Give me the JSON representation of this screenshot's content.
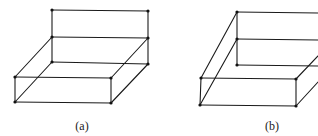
{
  "figures": [
    {
      "id": "a",
      "caption": "(a)",
      "caption_pos": [
        82,
        130
      ],
      "vertices": [
        [
          52,
          10
        ],
        [
          148,
          11
        ],
        [
          52,
          37
        ],
        [
          148,
          38
        ],
        [
          52,
          62
        ],
        [
          148,
          64
        ],
        [
          15,
          77
        ],
        [
          111,
          78
        ],
        [
          15,
          102
        ],
        [
          111,
          103
        ]
      ],
      "edges": [
        [
          [
            52,
            10
          ],
          [
            148,
            11
          ]
        ],
        [
          [
            52,
            10
          ],
          [
            52,
            62
          ]
        ],
        [
          [
            148,
            11
          ],
          [
            148,
            64
          ]
        ],
        [
          [
            52,
            37
          ],
          [
            148,
            38
          ]
        ],
        [
          [
            52,
            62
          ],
          [
            148,
            64
          ]
        ],
        [
          [
            52,
            37
          ],
          [
            15,
            77
          ]
        ],
        [
          [
            148,
            38
          ],
          [
            111,
            78
          ]
        ],
        [
          [
            52,
            62
          ],
          [
            15,
            102
          ]
        ],
        [
          [
            148,
            64
          ],
          [
            111,
            103
          ]
        ],
        [
          [
            15,
            77
          ],
          [
            111,
            78
          ]
        ],
        [
          [
            15,
            102
          ],
          [
            111,
            103
          ]
        ],
        [
          [
            15,
            77
          ],
          [
            15,
            102
          ]
        ],
        [
          [
            111,
            78
          ],
          [
            111,
            103
          ]
        ]
      ]
    },
    {
      "id": "b",
      "caption": "(b)",
      "caption_pos": [
        272,
        130
      ],
      "vertices": [
        [
          237,
          12
        ],
        [
          237,
          39
        ],
        [
          237,
          65
        ],
        [
          201,
          78
        ],
        [
          296,
          79
        ],
        [
          200,
          105
        ],
        [
          296,
          106
        ]
      ],
      "edges": [
        [
          [
            237,
            12
          ],
          [
            318,
            13
          ]
        ],
        [
          [
            237,
            39
          ],
          [
            318,
            40
          ]
        ],
        [
          [
            237,
            65
          ],
          [
            318,
            66
          ]
        ],
        [
          [
            237,
            12
          ],
          [
            237,
            65
          ]
        ],
        [
          [
            237,
            12
          ],
          [
            201,
            78
          ]
        ],
        [
          [
            237,
            39
          ],
          [
            200,
            105
          ]
        ],
        [
          [
            201,
            78
          ],
          [
            296,
            79
          ]
        ],
        [
          [
            200,
            105
          ],
          [
            296,
            106
          ]
        ],
        [
          [
            201,
            78
          ],
          [
            200,
            105
          ]
        ],
        [
          [
            296,
            79
          ],
          [
            296,
            106
          ]
        ],
        [
          [
            296,
            79
          ],
          [
            318,
            56
          ]
        ],
        [
          [
            296,
            106
          ],
          [
            318,
            82
          ]
        ]
      ]
    }
  ]
}
